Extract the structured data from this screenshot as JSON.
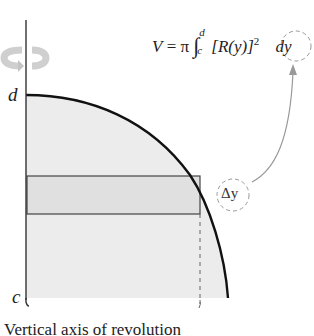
{
  "figure": {
    "title": "Vertical axis of revolution",
    "caption": "Vertical axis of revolution",
    "formula": {
      "lhs": "V",
      "equals": "=",
      "pi": "π",
      "integral": "∫",
      "upper_limit": "d",
      "lower_limit": "c",
      "integrand": "[R(y)]",
      "exponent": "2",
      "differential": "dy"
    },
    "axis_labels": {
      "top": "d",
      "bottom": "c"
    },
    "strip_label": "Δy",
    "rotation_icon": "rotation-arrow-icon",
    "colors": {
      "region_fill": "#ececec",
      "strip_fill": "#e2e2e2",
      "curve": "#111111",
      "axis": "#333333",
      "annotation": "#999999",
      "rotation_arrow": "#c8c8c8"
    }
  }
}
